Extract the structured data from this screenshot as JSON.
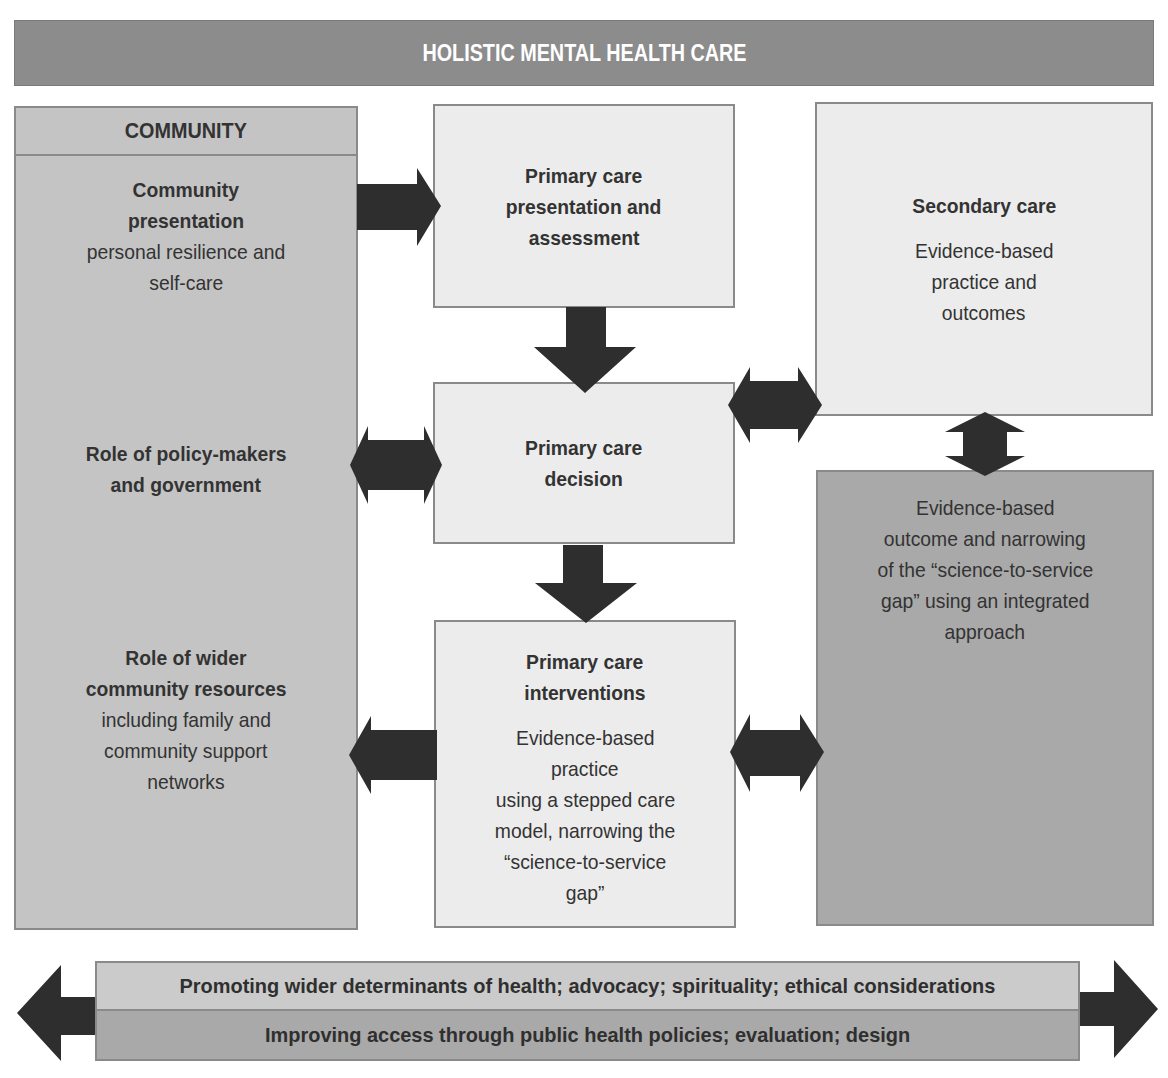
{
  "title": "HOLISTIC MENTAL HEALTH CARE",
  "community": {
    "header": "COMMUNITY",
    "sections": [
      {
        "title_lines": [
          "Community",
          "presentation"
        ],
        "body_lines": [
          "personal resilience and",
          "self-care"
        ]
      },
      {
        "title_lines": [
          "Role of policy-makers",
          "and government"
        ],
        "body_lines": []
      },
      {
        "title_lines": [
          "Role of wider",
          "community resources"
        ],
        "body_lines": [
          "including family and",
          "community support",
          "networks"
        ]
      }
    ]
  },
  "primary_care": {
    "presentation": {
      "title_lines": [
        "Primary care",
        "presentation and",
        "assessment"
      ]
    },
    "decision": {
      "title_lines": [
        "Primary care",
        "decision"
      ]
    },
    "interventions": {
      "title_lines": [
        "Primary care",
        "interventions"
      ],
      "body_lines": [
        "Evidence-based",
        "practice",
        "using a stepped care",
        "model, narrowing the",
        "“science-to-service",
        "gap”"
      ]
    }
  },
  "secondary_care": {
    "title": "Secondary care",
    "body_lines": [
      "Evidence-based",
      "practice and",
      "outcomes"
    ]
  },
  "evidence_outcome": {
    "body_lines": [
      "Evidence-based",
      "outcome and narrowing",
      "of the “science-to-service",
      "gap” using an integrated",
      "approach"
    ]
  },
  "bottom_bar": {
    "row1": "Promoting wider determinants of health; advocacy; spirituality; ethical considerations",
    "row2": "Improving access through public health policies; evaluation; design"
  },
  "arrows": [
    {
      "id": "community-to-presentation",
      "direction": "right"
    },
    {
      "id": "presentation-to-decision",
      "direction": "down"
    },
    {
      "id": "policy-decision",
      "direction": "bidirectional-horizontal"
    },
    {
      "id": "decision-secondary",
      "direction": "bidirectional-horizontal"
    },
    {
      "id": "secondary-evidence",
      "direction": "bidirectional-vertical"
    },
    {
      "id": "decision-to-interventions",
      "direction": "down"
    },
    {
      "id": "interventions-to-community",
      "direction": "left"
    },
    {
      "id": "interventions-evidence",
      "direction": "bidirectional-horizontal"
    },
    {
      "id": "bottom-bar",
      "direction": "bidirectional-horizontal"
    }
  ],
  "colors": {
    "banner": "#8c8c8c",
    "light_box": "#ececec",
    "mid_box": "#c4c4c4",
    "dark_box": "#a9a9a9",
    "arrow": "#2e2e2e",
    "border": "#8a8a8a"
  }
}
